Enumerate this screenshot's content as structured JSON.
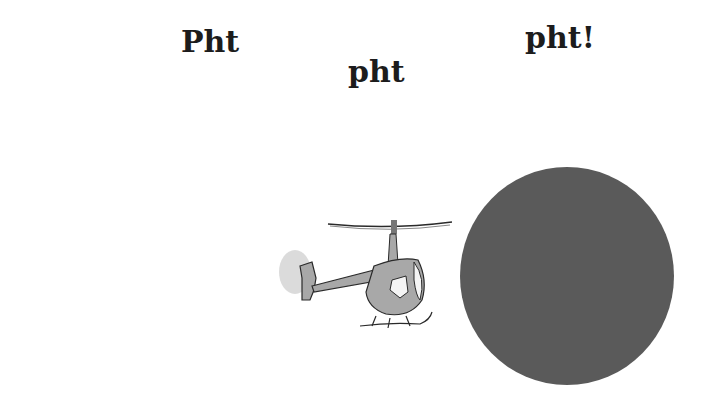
{
  "words": [
    {
      "text": "Pht"
    },
    {
      "text": "pht"
    },
    {
      "text": "pht!"
    }
  ],
  "illustration": {
    "helicopter": {
      "icon": "helicopter-icon",
      "body_color": "#a8a8a8",
      "line_color": "#2a2a2a"
    },
    "circle": {
      "color": "#5a5a5a"
    }
  }
}
